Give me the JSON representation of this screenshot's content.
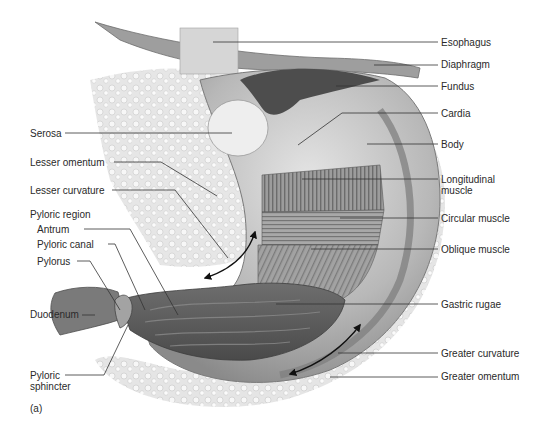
{
  "figure": {
    "panel_label": "(a)"
  },
  "labels_right": [
    {
      "id": "esophagus",
      "text": "Esophagus"
    },
    {
      "id": "diaphragm",
      "text": "Diaphragm"
    },
    {
      "id": "fundus",
      "text": "Fundus"
    },
    {
      "id": "cardia",
      "text": "Cardia"
    },
    {
      "id": "body",
      "text": "Body"
    },
    {
      "id": "longitudinal-muscle",
      "text": "Longitudinal muscle"
    },
    {
      "id": "circular-muscle",
      "text": "Circular muscle"
    },
    {
      "id": "oblique-muscle",
      "text": "Oblique muscle"
    },
    {
      "id": "gastric-rugae",
      "text": "Gastric rugae"
    },
    {
      "id": "greater-curvature",
      "text": "Greater curvature"
    },
    {
      "id": "greater-omentum",
      "text": "Greater omentum"
    }
  ],
  "labels_left": [
    {
      "id": "serosa",
      "text": "Serosa"
    },
    {
      "id": "lesser-omentum",
      "text": "Lesser omentum"
    },
    {
      "id": "lesser-curvature",
      "text": "Lesser curvature"
    },
    {
      "id": "pyloric-region",
      "text": "Pyloric region"
    },
    {
      "id": "antrum",
      "text": "Antrum"
    },
    {
      "id": "pyloric-canal",
      "text": "Pyloric canal"
    },
    {
      "id": "pylorus",
      "text": "Pylorus"
    },
    {
      "id": "duodenum",
      "text": "Duodenum"
    },
    {
      "id": "pyloric-sphincter",
      "text": "Pyloric sphincter"
    }
  ],
  "colors": {
    "leader_line": "#333333",
    "label_text": "#2a2a2a",
    "tissue_dark": "#5a5a5a",
    "tissue_mid": "#9a9a9a",
    "tissue_light": "#d8d8d8"
  }
}
